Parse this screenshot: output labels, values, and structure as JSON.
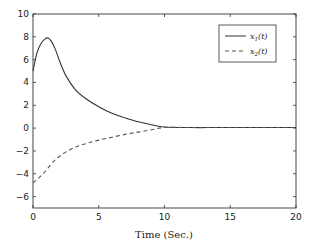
{
  "chart_data": {
    "type": "line",
    "title": "",
    "xlabel": "Time (Sec.)",
    "ylabel": "",
    "xlim": [
      0,
      20
    ],
    "ylim": [
      -7,
      10
    ],
    "xticks": [
      0,
      5,
      10,
      15,
      20
    ],
    "yticks": [
      -6,
      -4,
      -2,
      0,
      2,
      4,
      6,
      8,
      10
    ],
    "grid": false,
    "legend_position": "upper right",
    "series": [
      {
        "name": "x1(t)",
        "label": "x₁(t)",
        "style": "solid",
        "color": "#333333",
        "x": [
          0,
          0.3,
          0.6,
          0.9,
          1.15,
          1.4,
          1.7,
          2.05,
          2.5,
          3.2,
          4.0,
          5.1,
          6.0,
          7.0,
          8.0,
          9.0,
          10.0,
          12,
          14,
          16,
          18,
          20
        ],
        "y": [
          5.0,
          6.6,
          7.4,
          7.8,
          7.9,
          7.6,
          6.9,
          5.8,
          4.6,
          3.4,
          2.6,
          1.8,
          1.3,
          0.9,
          0.55,
          0.3,
          0.1,
          0.05,
          0.05,
          0.05,
          0.05,
          0.05
        ]
      },
      {
        "name": "x2(t)",
        "label": "x₂(t)",
        "style": "dashed",
        "color": "#555555",
        "x": [
          0,
          0.5,
          1.0,
          1.5,
          2.1,
          2.8,
          3.5,
          4.2,
          5.0,
          6.0,
          7.0,
          8.0,
          9.0,
          10.0,
          12,
          14,
          16,
          18,
          20
        ],
        "y": [
          -4.8,
          -4.3,
          -3.7,
          -3.0,
          -2.4,
          -1.9,
          -1.55,
          -1.3,
          -1.05,
          -0.8,
          -0.55,
          -0.35,
          -0.15,
          0.05,
          0.05,
          0.05,
          0.05,
          0.05,
          0.05
        ]
      }
    ]
  },
  "legend": {
    "entry1": "x",
    "entry1_sub": "1",
    "entry1_arg": "(t)",
    "entry2": "x",
    "entry2_sub": "2",
    "entry2_arg": "(t)"
  },
  "axes": {
    "xlabel": "Time (Sec.)",
    "xtick_labels": [
      "0",
      "5",
      "10",
      "15",
      "20"
    ],
    "ytick_labels": [
      "10",
      "8",
      "6",
      "4",
      "2",
      "0",
      "−2",
      "−4",
      "−6"
    ]
  }
}
